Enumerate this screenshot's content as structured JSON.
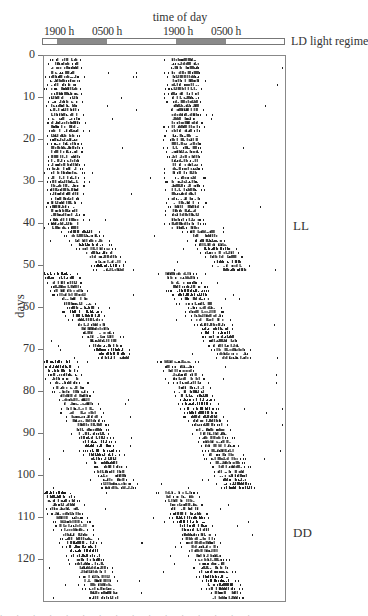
{
  "chart_data": {
    "type": "heatmap",
    "subtype": "double-plotted actogram",
    "title": "time of day",
    "xlabel": "time of day",
    "ylabel": "days",
    "time_tick_labels": [
      "1900 h",
      "0500 h",
      "1900 h",
      "0500 h"
    ],
    "light_regime_label": "LD light regime",
    "y_ticks": [
      0,
      10,
      20,
      30,
      40,
      50,
      60,
      70,
      80,
      90,
      100,
      110,
      120
    ],
    "ylim": [
      0,
      130
    ],
    "grid": false,
    "regimes": [
      {
        "label": "LL",
        "label_day": 40
      },
      {
        "label": "DD",
        "label_day": 113
      }
    ],
    "ld_dark_segments_fraction": [
      [
        0.058,
        0.267
      ],
      [
        0.55,
        0.758
      ]
    ],
    "activity_phases": [
      {
        "days": [
          0,
          41
        ],
        "onset_fraction": 0.06,
        "duration_fraction": 0.22,
        "drift_per_day": 0.0
      },
      {
        "days": [
          41,
          51
        ],
        "onset_fraction": 0.2,
        "duration_fraction": 0.22,
        "drift_per_day": 0.03
      },
      {
        "days": [
          51,
          72
        ],
        "onset_fraction": 0.0,
        "duration_fraction": 0.22,
        "drift_per_day": 0.024
      },
      {
        "days": [
          72,
          103
        ],
        "onset_fraction": 0.0,
        "duration_fraction": 0.22,
        "drift_per_day": 0.017
      },
      {
        "days": [
          103,
          130
        ],
        "onset_fraction": 0.0,
        "duration_fraction": 0.22,
        "drift_per_day": 0.016
      }
    ]
  },
  "figure": {
    "title": "time of day",
    "ld_bar_label": "LD light regime",
    "time_labels": [
      {
        "text": "1900 h",
        "x": 44
      },
      {
        "text": "0500 h",
        "x": 92
      },
      {
        "text": "1900 h",
        "x": 163
      },
      {
        "text": "0500 h",
        "x": 211
      }
    ],
    "y_axis_label": "days",
    "regime_labels": [
      {
        "text": "LL",
        "y": 218
      },
      {
        "text": "DD",
        "y": 525
      }
    ],
    "caption_fragment": ". . . . . . . . . . . . . . . ."
  },
  "colors": {
    "dark_period": "#8a8a8a",
    "activity": "#222222",
    "axis": "#777777"
  }
}
